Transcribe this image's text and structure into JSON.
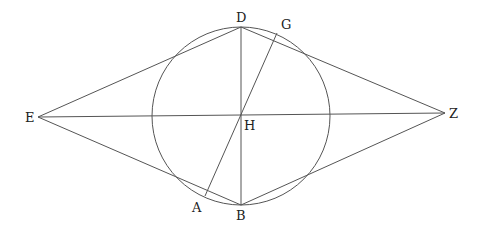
{
  "diagram": {
    "type": "geometric-figure",
    "circle": {
      "cx": 241,
      "cy": 116,
      "r": 89
    },
    "stroke_color": "#444444",
    "points": {
      "D": {
        "x": 241,
        "y": 27
      },
      "B": {
        "x": 241,
        "y": 205
      },
      "E": {
        "x": 38,
        "y": 117
      },
      "Z": {
        "x": 445,
        "y": 113
      },
      "H": {
        "x": 241,
        "y": 115
      },
      "G": {
        "x": 277,
        "y": 33
      },
      "A": {
        "x": 205,
        "y": 196
      }
    },
    "labels": {
      "D": "D",
      "G": "G",
      "E": "E",
      "H": "H",
      "Z": "Z",
      "A": "A",
      "B": "B"
    },
    "segments": [
      [
        "E",
        "D"
      ],
      [
        "D",
        "Z"
      ],
      [
        "Z",
        "B"
      ],
      [
        "B",
        "E"
      ],
      [
        "D",
        "B"
      ],
      [
        "E",
        "Z"
      ],
      [
        "A",
        "G"
      ]
    ]
  }
}
